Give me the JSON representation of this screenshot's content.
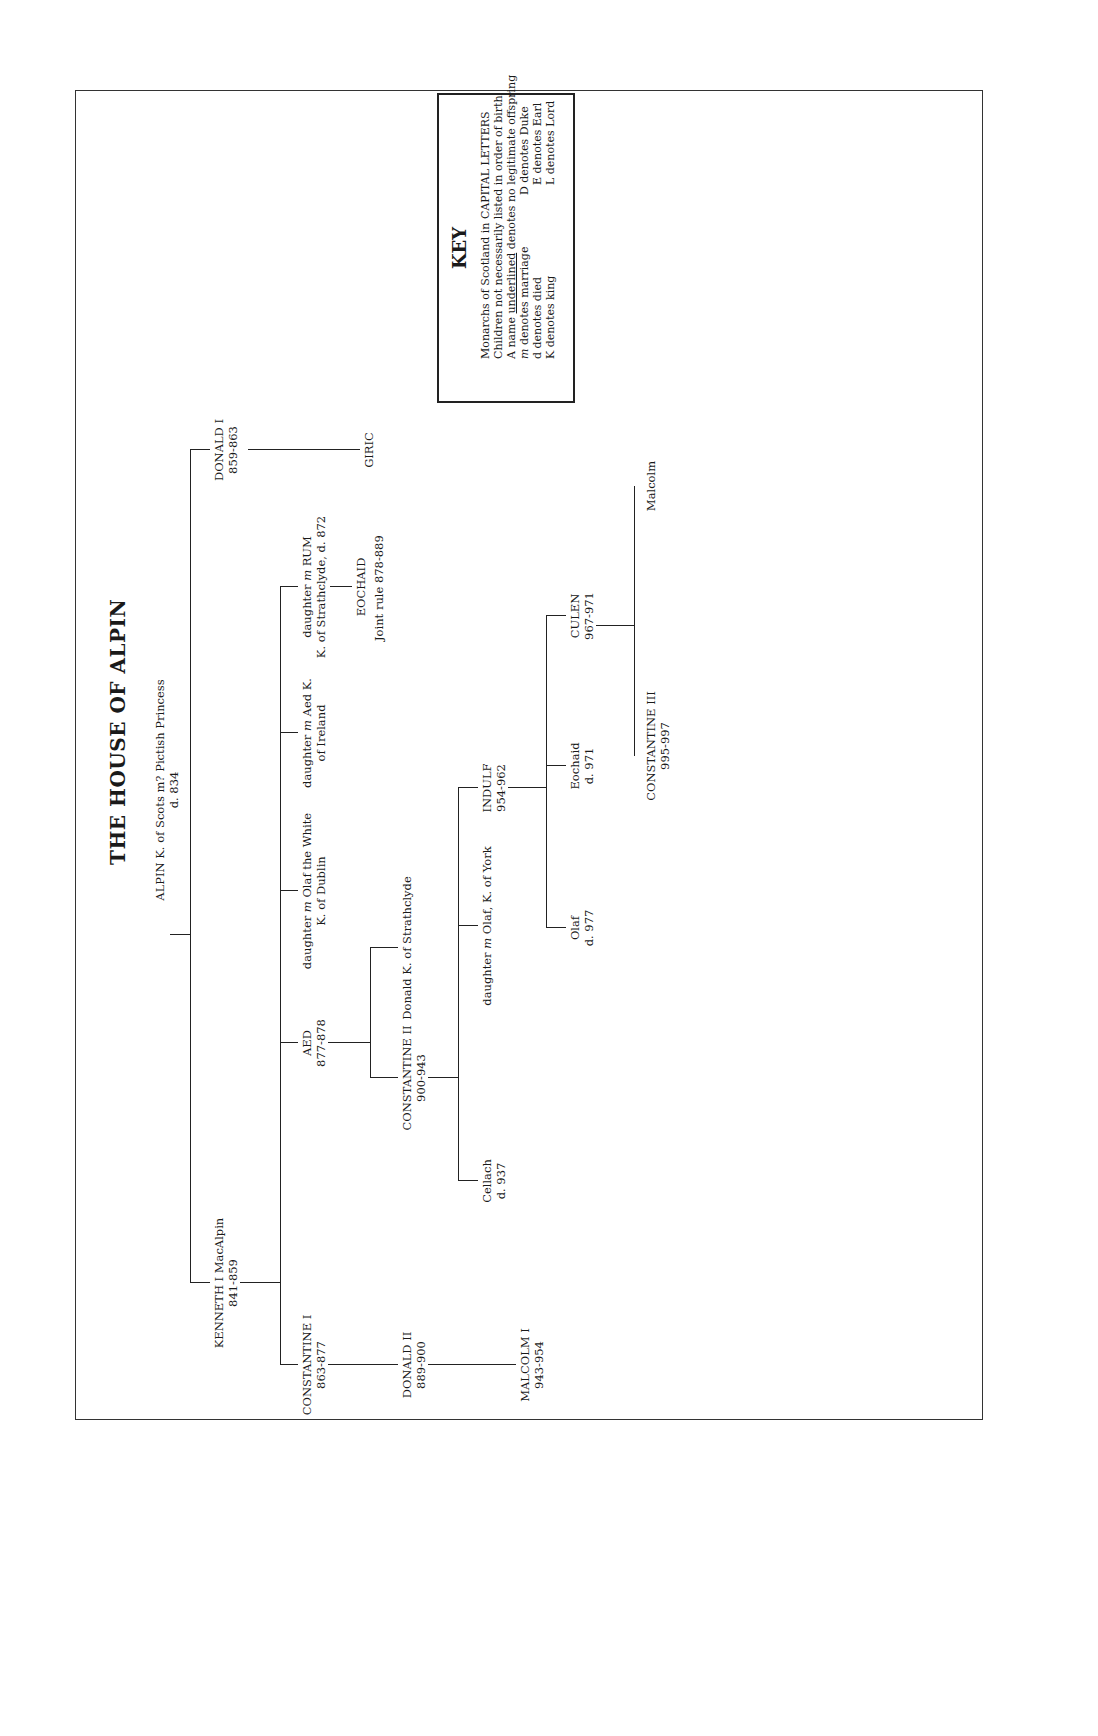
{
  "title": "THE HOUSE OF ALPIN",
  "key": {
    "heading": "KEY",
    "lines": [
      "Monarchs of Scotland in CAPITAL LETTERS",
      "Children not necessarily listed in order of birth",
      "A name underlined denotes no legitimate offspring",
      "m denotes marriage",
      "d denotes died",
      "K denotes king"
    ],
    "right_lines": [
      "D denotes Duke",
      "E denotes Earl",
      "L denotes Lord"
    ]
  },
  "people": {
    "alpin": {
      "line1": "ALPIN K. of Scots m? Pictish Princess",
      "line2": "d. 834"
    },
    "kenneth1": {
      "name": "KENNETH I MacAlpin",
      "dates": "841-859"
    },
    "donald1": {
      "name": "DONALD I",
      "dates": "859-863"
    },
    "giric": {
      "name": "GIRIC"
    },
    "constantine1": {
      "name": "CONSTANTINE I",
      "dates": "863-877"
    },
    "aed": {
      "name": "AED",
      "dates": "877-878"
    },
    "dau_olaf_white": {
      "line1": "daughter m Olaf the White",
      "line2": "K. of Dublin"
    },
    "dau_aed_ireland": {
      "line1": "daughter m Aed K.",
      "line2": "of Ireland"
    },
    "dau_rum": {
      "line1": "daughter m RUM",
      "line2": "K. of Strathclyde, d. 872"
    },
    "eochaid": {
      "name": "EOCHAID",
      "note": "Joint rule 878-889"
    },
    "donald2": {
      "name": "DONALD II",
      "dates": "889-900"
    },
    "constantine2": {
      "name": "CONSTANTINE II",
      "dates": "900-943"
    },
    "donald_strath": {
      "name": "Donald K. of Strathclyde"
    },
    "malcolm1": {
      "name": "MALCOLM I",
      "dates": "943-954"
    },
    "cellach": {
      "name": "Cellach",
      "dates": "d. 937"
    },
    "dau_olaf_york": {
      "line1": "daughter m Olaf, K. of York"
    },
    "indulf": {
      "name": "INDULF",
      "dates": "954-962"
    },
    "olaf": {
      "name": "Olaf",
      "dates": "d. 977"
    },
    "eochaid2": {
      "name": "Eochaid",
      "dates": "d. 971"
    },
    "culen": {
      "name": "CULEN",
      "dates": "967-971"
    },
    "constantine3": {
      "name": "CONSTANTINE III",
      "dates": "995-997"
    },
    "malcolm_c": {
      "name": "Malcolm"
    },
    "dubh": {
      "name": "DUBH",
      "dates": "962-967"
    },
    "kenneth2": {
      "name": "KENNETH II",
      "dates": "971-995"
    },
    "kenneth3": {
      "name": "KENNETH III",
      "dates": "997-1005"
    },
    "malcolm_strath": {
      "line1": "Malcolm K. of",
      "line2": "Strathclyde"
    },
    "dungal": {
      "name": "Dungal",
      "dates": "d. 999"
    },
    "malcolm2": {
      "name": "MALCOLM II",
      "dates": "1005-1034"
    },
    "bethoc": {
      "line1": "Bethoc m Crinan, Abbot",
      "line2": "of Dunkeld d. 1045"
    },
    "donada": {
      "line1": "Donada m Sigurd the Stout",
      "line2": "E. of Orkney d. 1014"
    },
    "daughter_find": {
      "line1": "Daughter m Findlaech",
      "line2": "Mormaer",
      "line3": "of Moray",
      "line4": "d. 1010"
    },
    "duncan1": {
      "name": "DUNCAN I",
      "dates": "1034-1040"
    },
    "maldred": {
      "name": "Maldred"
    },
    "thorfin": {
      "name": "Thorfin"
    },
    "macbeth_top": {
      "name": "MACBETH",
      "dates": "1040-1057"
    },
    "gillacomean1": {
      "name": "Gillacomean"
    },
    "givic": {
      "name": "Givic",
      "dates": "d. 1005"
    },
    "bodhe": {
      "name": "Bodhe"
    },
    "son": {
      "name": "Son"
    },
    "son2": {
      "line1": "Son d. 1032",
      "line2": "Last male in senior",
      "line3": "line of House of Alpin"
    },
    "macbeth2": {
      "name": "MACBETH",
      "marriage_num": "2",
      "spouse": "Cruoch m Gillacomean",
      "dates": "1040-1057",
      "spouse_note1": "Mormaer of Moray",
      "spouse_note2": "d. 1032"
    },
    "lulach": {
      "name": "LULACH",
      "dates": "1057-1058"
    }
  }
}
